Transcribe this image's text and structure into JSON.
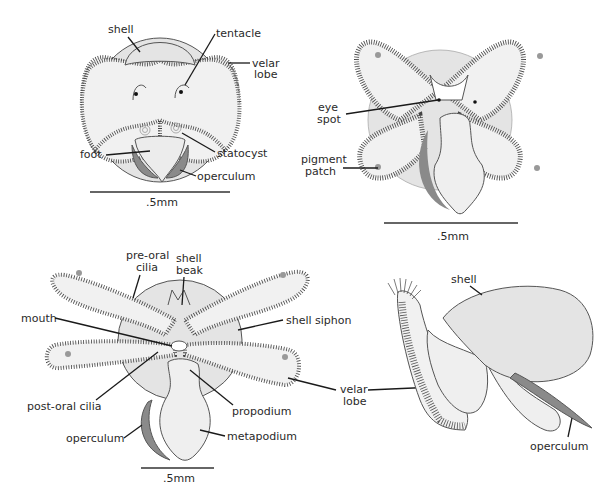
{
  "figure": {
    "type": "anatomical diagram",
    "colors": {
      "background": "#ffffff",
      "body": "#ececec",
      "shell": "#e4e4e4",
      "lobe": "#f1f1f1",
      "operculum": "#8a8a8a",
      "outline": "#555555",
      "label_text": "#2a2a2a",
      "leader_line": "#1a1a1a"
    }
  },
  "panels": {
    "top_left": {
      "view": "frontal view, velum retracted",
      "labels": {
        "shell": "shell",
        "tentacle": "tentacle",
        "velar_lobe_1": "velar",
        "velar_lobe_2": "lobe",
        "statocyst": "statocyst",
        "foot": "foot",
        "operculum": "operculum"
      },
      "scale_bar": ".5mm"
    },
    "top_right": {
      "view": "frontal view, four-lobed velum",
      "labels": {
        "eye_spot_1": "eye",
        "eye_spot_2": "spot",
        "pigment_patch_1": "pigment",
        "pigment_patch_2": "patch"
      },
      "scale_bar": ".5mm"
    },
    "bottom_left": {
      "view": "ventral view, elongated velar lobes",
      "labels": {
        "pre_oral_cilia_1": "pre-oral",
        "pre_oral_cilia_2": "cilia",
        "shell_beak_1": "shell",
        "shell_beak_2": "beak",
        "mouth": "mouth",
        "shell_siphon": "shell siphon",
        "post_oral_cilia": "post-oral cilia",
        "propodium": "propodium",
        "operculum": "operculum",
        "metapodium": "metapodium"
      },
      "scale_bar": ".5mm"
    },
    "bottom_right": {
      "view": "lateral view",
      "labels": {
        "shell": "shell",
        "operculum": "operculum"
      }
    },
    "shared_labels": {
      "velar_lobe_1": "velar",
      "velar_lobe_2": "lobe"
    }
  }
}
